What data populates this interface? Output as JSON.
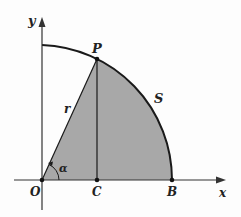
{
  "diagram": {
    "labels": {
      "y_axis": "y",
      "x_axis": "x",
      "origin": "O",
      "point_p": "P",
      "point_c": "C",
      "point_b": "B",
      "radius": "r",
      "arc": "S",
      "angle": "α"
    },
    "colors": {
      "fill": "#a8a8a8",
      "stroke": "#1a1a1a",
      "background": "#fdfdfd"
    }
  }
}
